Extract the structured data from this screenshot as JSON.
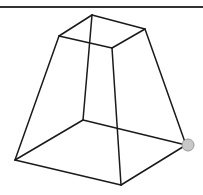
{
  "diagram": {
    "type": "frustum-wireframe",
    "line_color": "#1a1a1a",
    "handle_color": "#c8c8c8",
    "handle_stroke": "#999999",
    "top_face": {
      "back": [
        92,
        15
      ],
      "left": [
        59,
        36
      ],
      "front": [
        112,
        48
      ],
      "right": [
        145,
        29
      ]
    },
    "bottom_face": {
      "back": [
        83,
        120
      ],
      "left": [
        15,
        160
      ],
      "front": [
        121,
        185
      ],
      "right": [
        186,
        145
      ]
    },
    "handle": {
      "cx": 188,
      "cy": 145,
      "r": 6
    }
  }
}
